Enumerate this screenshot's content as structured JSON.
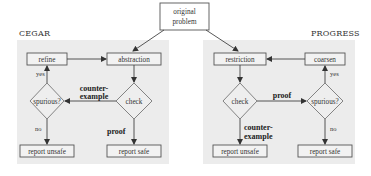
{
  "diagram": {
    "top_node": {
      "line1": "original",
      "line2": "problem"
    },
    "cegar": {
      "title": "CEGAR",
      "nodes": {
        "refine": "refine",
        "abstraction": "abstraction",
        "spurious": "spurious?",
        "check": "check",
        "report_unsafe": "report unsafe",
        "report_safe": "report safe"
      },
      "edges": {
        "yes": "yes",
        "no": "no",
        "counterexample_line1": "counter-",
        "counterexample_line2": "example",
        "proof": "proof"
      }
    },
    "progress": {
      "title": "PROGRESS",
      "nodes": {
        "restriction": "restriction",
        "coarsen": "coarsen",
        "check": "check",
        "spurious": "spurious?",
        "report_unsafe": "report unsafe",
        "report_safe": "report safe"
      },
      "edges": {
        "yes": "yes",
        "no": "no",
        "proof": "proof",
        "counterexample_line1": "counter-",
        "counterexample_line2": "example"
      }
    },
    "colors": {
      "panel_background": "#ececec",
      "stroke": "#555555",
      "text": "#333333"
    }
  }
}
